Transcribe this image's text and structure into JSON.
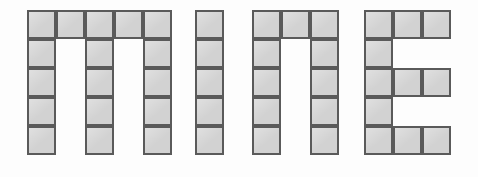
{
  "canvas": {
    "width": 478,
    "height": 177,
    "background_color": "#fdfdfd"
  },
  "figure": {
    "word": "mine",
    "cell_size": 29,
    "cell_fill_color": "#d2d2d2",
    "cell_border_color": "#5a5a5a",
    "cell_border_width": 2,
    "rows": 5,
    "grid_top": 10
  },
  "letters": [
    {
      "id": "letter-m",
      "character": "m",
      "origin_x": 27,
      "origin_y": 10,
      "columns": 5,
      "rows": 5,
      "cell_count": 17,
      "cells": [
        [
          0,
          0
        ],
        [
          1,
          0
        ],
        [
          2,
          0
        ],
        [
          3,
          0
        ],
        [
          4,
          0
        ],
        [
          0,
          1
        ],
        [
          2,
          1
        ],
        [
          4,
          1
        ],
        [
          0,
          2
        ],
        [
          2,
          2
        ],
        [
          4,
          2
        ],
        [
          0,
          3
        ],
        [
          2,
          3
        ],
        [
          4,
          3
        ],
        [
          0,
          4
        ],
        [
          2,
          4
        ],
        [
          4,
          4
        ]
      ]
    },
    {
      "id": "letter-i",
      "character": "i",
      "origin_x": 195,
      "origin_y": 10,
      "columns": 1,
      "rows": 5,
      "cell_count": 5,
      "cells": [
        [
          0,
          0
        ],
        [
          0,
          1
        ],
        [
          0,
          2
        ],
        [
          0,
          3
        ],
        [
          0,
          4
        ]
      ]
    },
    {
      "id": "letter-n",
      "character": "n",
      "origin_x": 252,
      "origin_y": 10,
      "columns": 3,
      "rows": 5,
      "cell_count": 11,
      "cells": [
        [
          0,
          0
        ],
        [
          1,
          0
        ],
        [
          2,
          0
        ],
        [
          0,
          1
        ],
        [
          2,
          1
        ],
        [
          0,
          2
        ],
        [
          2,
          2
        ],
        [
          0,
          3
        ],
        [
          2,
          3
        ],
        [
          0,
          4
        ],
        [
          2,
          4
        ]
      ]
    },
    {
      "id": "letter-e",
      "character": "E",
      "origin_x": 364,
      "origin_y": 10,
      "columns": 3,
      "rows": 5,
      "cell_count": 11,
      "cells": [
        [
          0,
          0
        ],
        [
          1,
          0
        ],
        [
          2,
          0
        ],
        [
          0,
          1
        ],
        [
          0,
          2
        ],
        [
          1,
          2
        ],
        [
          2,
          2
        ],
        [
          0,
          3
        ],
        [
          0,
          4
        ],
        [
          1,
          4
        ],
        [
          2,
          4
        ]
      ]
    }
  ]
}
